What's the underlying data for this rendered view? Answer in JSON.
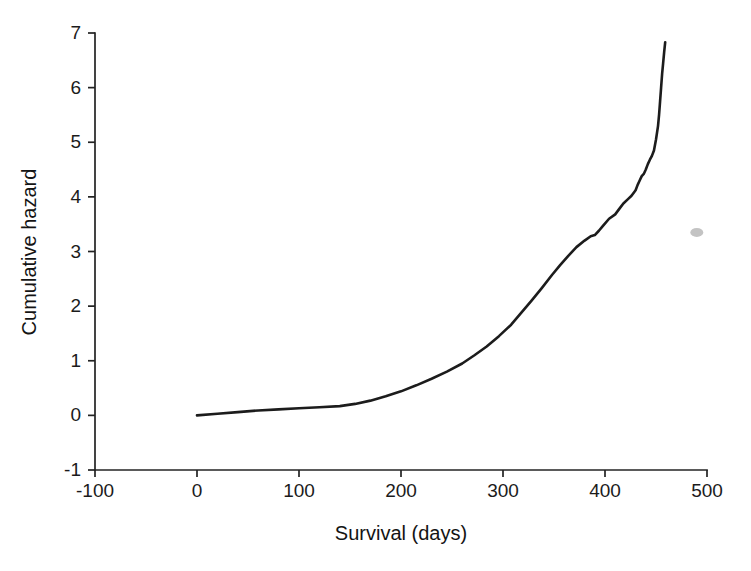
{
  "figure": {
    "name": "cumulative-hazard-plot",
    "background_color": "#ffffff",
    "line_color": "#1c1c1c",
    "axis_color": "#232323",
    "blemish_color": "#b9b9b9"
  },
  "chart_data": {
    "type": "line",
    "title": "",
    "subtitle": "",
    "xlabel": "Survival (days)",
    "ylabel": "Cumulative hazard",
    "xlim": [
      -100,
      500
    ],
    "ylim": [
      -1,
      7
    ],
    "xticks": [
      -100,
      0,
      100,
      200,
      300,
      400,
      500
    ],
    "xticklabels": [
      "-100",
      "0",
      "100",
      "200",
      "300",
      "400",
      "500"
    ],
    "yticks": [
      -1,
      0,
      1,
      2,
      3,
      4,
      5,
      6,
      7
    ],
    "yticklabels": [
      "-1",
      "0",
      "1",
      "2",
      "3",
      "4",
      "5",
      "6",
      "7"
    ],
    "grid": false,
    "legend": null,
    "legend_position": "none",
    "tick_direction": "out",
    "spines": [
      "left",
      "bottom"
    ],
    "annotations": [
      {
        "name": "scan-blemish",
        "kind": "artifact",
        "x": 490,
        "y": 3.35,
        "color": "#b9b9b9"
      }
    ],
    "series": [
      {
        "name": "Cumulative hazard",
        "style": "stepped-line",
        "color": "#1c1c1c",
        "x": [
          0,
          20,
          40,
          60,
          80,
          100,
          120,
          140,
          155,
          170,
          185,
          200,
          215,
          230,
          245,
          260,
          272,
          284,
          296,
          308,
          318,
          328,
          338,
          348,
          356,
          364,
          372,
          380,
          386,
          390,
          394,
          398,
          404,
          410,
          414,
          418,
          422,
          426,
          430,
          432,
          434,
          436,
          438,
          440,
          442,
          444,
          446,
          448,
          450,
          452,
          453,
          454,
          455,
          456,
          457,
          458,
          459
        ],
        "y": [
          0.0,
          0.03,
          0.06,
          0.09,
          0.11,
          0.13,
          0.15,
          0.17,
          0.21,
          0.27,
          0.35,
          0.44,
          0.55,
          0.67,
          0.8,
          0.95,
          1.1,
          1.26,
          1.45,
          1.66,
          1.88,
          2.1,
          2.33,
          2.57,
          2.75,
          2.92,
          3.08,
          3.2,
          3.28,
          3.3,
          3.38,
          3.47,
          3.6,
          3.68,
          3.78,
          3.88,
          3.95,
          4.02,
          4.12,
          4.22,
          4.3,
          4.38,
          4.42,
          4.5,
          4.6,
          4.68,
          4.75,
          4.85,
          5.05,
          5.3,
          5.5,
          5.75,
          6.0,
          6.25,
          6.45,
          6.65,
          6.83
        ]
      }
    ]
  }
}
